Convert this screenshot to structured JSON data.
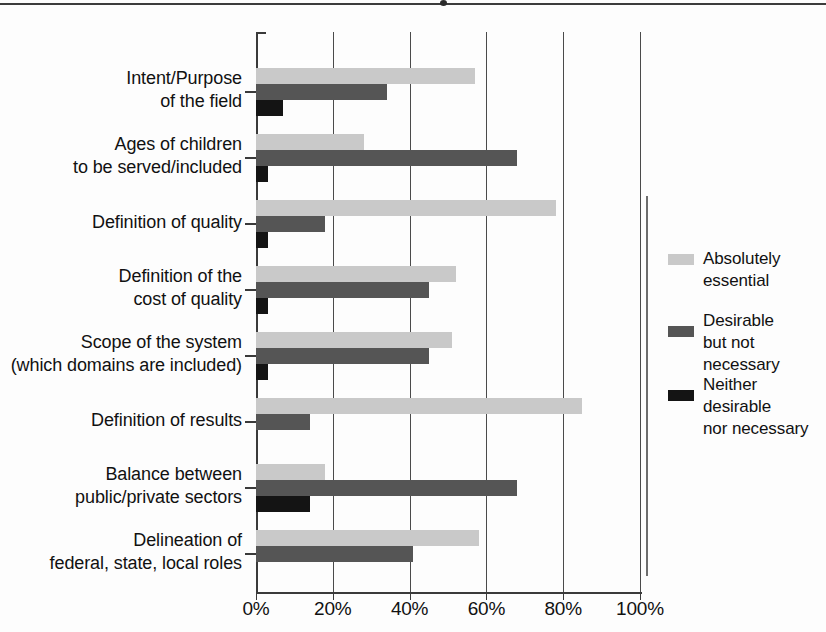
{
  "chart_data": {
    "type": "bar",
    "orientation": "horizontal",
    "title": "",
    "xlabel": "",
    "ylabel": "",
    "xlim": [
      0,
      100
    ],
    "xticks": [
      0,
      20,
      40,
      60,
      80,
      100
    ],
    "xtick_labels": [
      "0%",
      "20%",
      "40%",
      "60%",
      "80%",
      "100%"
    ],
    "grid": true,
    "legend_position": "right",
    "categories": [
      "Intent/Purpose\nof the field",
      "Ages of children\nto be served/included",
      "Definition of quality",
      "Definition of the\ncost of quality",
      "Scope of the system\n(which domains are included)",
      "Definition of results",
      "Balance between\npublic/private sectors",
      "Delineation of\nfederal, state, local roles"
    ],
    "series": [
      {
        "name": "Absolutely essential",
        "color": "#c9c9c9",
        "values": [
          57,
          28,
          78,
          52,
          51,
          85,
          18,
          58
        ]
      },
      {
        "name": "Desirable\nbut not necessary",
        "color": "#555555",
        "values": [
          34,
          68,
          18,
          45,
          45,
          14,
          68,
          41
        ]
      },
      {
        "name": "Neither desirable\nnor necessary",
        "color": "#141414",
        "values": [
          7,
          3,
          3,
          3,
          3,
          0,
          14,
          0
        ]
      }
    ]
  },
  "legend": {
    "entries": [
      "Absolutely essential",
      "Desirable\nbut not necessary",
      "Neither desirable\nnor necessary"
    ]
  }
}
